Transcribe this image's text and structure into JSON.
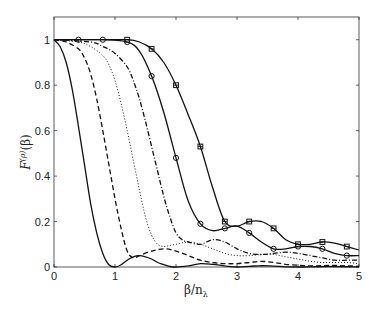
{
  "chart_data": {
    "type": "line",
    "title": "",
    "xlabel": "β/n_λ",
    "ylabel": "F^(ρ)(β)",
    "xlim": [
      0,
      5
    ],
    "ylim": [
      0,
      1.1
    ],
    "xticks": [
      0,
      1,
      2,
      3,
      4,
      5
    ],
    "yticks": [
      0,
      0.2,
      0.4,
      0.6,
      0.8,
      1
    ],
    "xtick_labels": [
      "0",
      "1",
      "2",
      "3",
      "4",
      "5"
    ],
    "ytick_labels": [
      "0",
      "0.2",
      "0.4",
      "0.6",
      "0.8",
      "1"
    ],
    "grid": false,
    "legend": null,
    "series": [
      {
        "name": "solid",
        "style": "solid",
        "marker": "none",
        "x": [
          0,
          0.1,
          0.2,
          0.3,
          0.4,
          0.5,
          0.6,
          0.7,
          0.8,
          0.9,
          1.0,
          1.1,
          1.2,
          1.3,
          1.4,
          1.5,
          1.6,
          1.7,
          1.8,
          1.9,
          2.0,
          2.2,
          2.4,
          2.6,
          2.8,
          3.0,
          3.2,
          3.4,
          3.6,
          3.8,
          4.0,
          4.5,
          5.0
        ],
        "y": [
          1.0,
          0.97,
          0.9,
          0.78,
          0.62,
          0.45,
          0.28,
          0.15,
          0.06,
          0.01,
          0.0,
          0.01,
          0.03,
          0.045,
          0.05,
          0.045,
          0.035,
          0.02,
          0.01,
          0.002,
          0.0,
          0.005,
          0.015,
          0.012,
          0.005,
          0.0,
          0.003,
          0.006,
          0.004,
          0.001,
          0.0,
          0.002,
          0.0
        ]
      },
      {
        "name": "dashed",
        "style": "dashed",
        "marker": "none",
        "x": [
          0,
          0.2,
          0.4,
          0.5,
          0.6,
          0.7,
          0.8,
          0.9,
          1.0,
          1.1,
          1.2,
          1.3,
          1.4,
          1.6,
          1.8,
          2.0,
          2.2,
          2.4,
          2.6,
          2.8,
          3.0,
          3.2,
          3.4,
          3.6,
          3.8,
          4.0,
          4.2,
          4.4,
          4.6,
          4.8,
          5.0
        ],
        "y": [
          1.0,
          0.99,
          0.96,
          0.92,
          0.85,
          0.74,
          0.6,
          0.45,
          0.3,
          0.17,
          0.07,
          0.04,
          0.05,
          0.07,
          0.08,
          0.07,
          0.05,
          0.03,
          0.02,
          0.015,
          0.015,
          0.02,
          0.025,
          0.02,
          0.012,
          0.008,
          0.005,
          0.006,
          0.007,
          0.005,
          0.003
        ]
      },
      {
        "name": "dotted",
        "style": "dotted",
        "marker": "none",
        "x": [
          0,
          0.4,
          0.6,
          0.8,
          0.9,
          1.0,
          1.1,
          1.2,
          1.3,
          1.4,
          1.5,
          1.6,
          1.7,
          1.8,
          1.9,
          2.0,
          2.2,
          2.4,
          2.6,
          2.8,
          3.0,
          3.2,
          3.4,
          3.6,
          3.8,
          4.0,
          4.2,
          4.4,
          4.6,
          4.8,
          5.0
        ],
        "y": [
          1.0,
          0.99,
          0.97,
          0.93,
          0.89,
          0.82,
          0.72,
          0.6,
          0.47,
          0.34,
          0.22,
          0.14,
          0.1,
          0.09,
          0.095,
          0.1,
          0.11,
          0.1,
          0.08,
          0.06,
          0.05,
          0.05,
          0.055,
          0.055,
          0.045,
          0.035,
          0.025,
          0.02,
          0.02,
          0.02,
          0.015
        ]
      },
      {
        "name": "dash-dot",
        "style": "dashdot",
        "marker": "none",
        "x": [
          0,
          0.6,
          0.8,
          1.0,
          1.2,
          1.3,
          1.4,
          1.5,
          1.6,
          1.7,
          1.8,
          1.9,
          2.0,
          2.1,
          2.2,
          2.4,
          2.6,
          2.8,
          3.0,
          3.2,
          3.4,
          3.6,
          3.8,
          4.0,
          4.2,
          4.4,
          4.6,
          4.8,
          5.0
        ],
        "y": [
          1.0,
          0.99,
          0.97,
          0.94,
          0.88,
          0.82,
          0.74,
          0.64,
          0.53,
          0.42,
          0.31,
          0.22,
          0.15,
          0.12,
          0.11,
          0.1,
          0.12,
          0.11,
          0.08,
          0.06,
          0.055,
          0.06,
          0.065,
          0.06,
          0.05,
          0.04,
          0.03,
          0.03,
          0.03
        ]
      },
      {
        "name": "solid-circle",
        "style": "solid",
        "marker": "circle",
        "x": [
          0,
          0.4,
          0.8,
          1.2,
          1.4,
          1.6,
          1.8,
          2.0,
          2.2,
          2.4,
          2.6,
          2.8,
          3.0,
          3.2,
          3.4,
          3.6,
          3.8,
          4.0,
          4.2,
          4.4,
          4.6,
          4.8,
          5.0
        ],
        "y": [
          1.0,
          1.0,
          1.0,
          0.99,
          0.95,
          0.84,
          0.68,
          0.48,
          0.29,
          0.19,
          0.16,
          0.17,
          0.18,
          0.15,
          0.11,
          0.08,
          0.08,
          0.09,
          0.09,
          0.08,
          0.06,
          0.05,
          0.05
        ],
        "marker_x": [
          0.4,
          0.8,
          1.2,
          1.6,
          2.0,
          2.4,
          2.8,
          3.2,
          3.6,
          4.0,
          4.4,
          4.8
        ],
        "marker_y": [
          1.0,
          1.0,
          0.99,
          0.84,
          0.48,
          0.19,
          0.17,
          0.15,
          0.08,
          0.09,
          0.08,
          0.05
        ]
      },
      {
        "name": "solid-square",
        "style": "solid",
        "marker": "square",
        "x": [
          0,
          0.4,
          0.8,
          1.2,
          1.4,
          1.6,
          1.8,
          2.0,
          2.2,
          2.4,
          2.6,
          2.8,
          3.0,
          3.2,
          3.4,
          3.6,
          3.8,
          4.0,
          4.2,
          4.4,
          4.6,
          4.8,
          5.0
        ],
        "y": [
          1.0,
          1.0,
          1.0,
          1.0,
          0.99,
          0.96,
          0.9,
          0.8,
          0.67,
          0.53,
          0.35,
          0.2,
          0.18,
          0.2,
          0.2,
          0.17,
          0.12,
          0.1,
          0.1,
          0.11,
          0.105,
          0.09,
          0.075
        ],
        "marker_x": [
          1.2,
          1.6,
          2.0,
          2.4,
          2.8,
          3.2,
          3.6,
          4.0,
          4.4,
          4.8
        ],
        "marker_y": [
          1.0,
          0.96,
          0.8,
          0.53,
          0.2,
          0.2,
          0.17,
          0.1,
          0.11,
          0.09
        ]
      }
    ]
  },
  "axes": {
    "xlabel_main": "β/n",
    "xlabel_sub": "λ",
    "ylabel_main": "F",
    "ylabel_sup": "(ρ)",
    "ylabel_arg": "(β)"
  }
}
